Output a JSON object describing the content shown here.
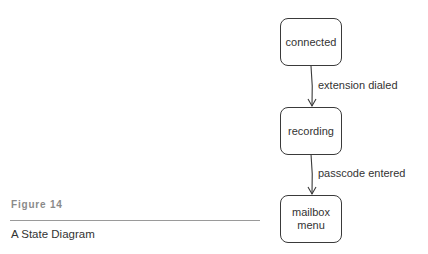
{
  "figure": {
    "label": "Figure 14",
    "title": "A State Diagram"
  },
  "states": [
    {
      "id": "connected",
      "label": "connected"
    },
    {
      "id": "recording",
      "label": "recording"
    },
    {
      "id": "mailbox-menu",
      "label": "mailbox\nmenu"
    }
  ],
  "transitions": [
    {
      "from": "connected",
      "to": "recording",
      "label": "extension dialed"
    },
    {
      "from": "recording",
      "to": "mailbox-menu",
      "label": "passcode entered"
    }
  ],
  "colors": {
    "stroke": "#3a3a3a",
    "text": "#333333",
    "figure_label": "#8a8a8a",
    "rule": "#9a9a9a"
  }
}
